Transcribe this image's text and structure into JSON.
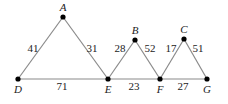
{
  "diagram": {
    "type": "graph",
    "vertices": [
      {
        "id": "A",
        "label": "A",
        "x": 63,
        "y": 17
      },
      {
        "id": "B",
        "label": "B",
        "x": 135,
        "y": 40
      },
      {
        "id": "C",
        "label": "C",
        "x": 184,
        "y": 39
      },
      {
        "id": "D",
        "label": "D",
        "x": 18,
        "y": 79
      },
      {
        "id": "E",
        "label": "E",
        "x": 108,
        "y": 79
      },
      {
        "id": "F",
        "label": "F",
        "x": 160,
        "y": 79
      },
      {
        "id": "G",
        "label": "G",
        "x": 207,
        "y": 79
      }
    ],
    "edges": [
      {
        "from": "A",
        "to": "D",
        "weight": "41"
      },
      {
        "from": "A",
        "to": "E",
        "weight": "31"
      },
      {
        "from": "D",
        "to": "E",
        "weight": "71"
      },
      {
        "from": "E",
        "to": "B",
        "weight": "28"
      },
      {
        "from": "B",
        "to": "F",
        "weight": "52"
      },
      {
        "from": "E",
        "to": "F",
        "weight": "23"
      },
      {
        "from": "F",
        "to": "C",
        "weight": "17"
      },
      {
        "from": "C",
        "to": "G",
        "weight": "51"
      },
      {
        "from": "F",
        "to": "G",
        "weight": "27"
      }
    ]
  }
}
